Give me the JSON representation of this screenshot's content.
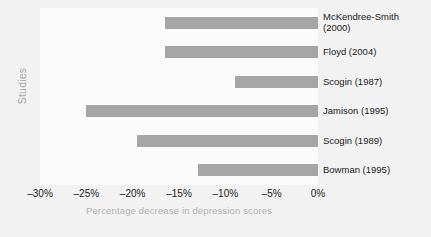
{
  "chart_data": {
    "type": "bar",
    "orientation": "horizontal",
    "title": "",
    "xlabel": "Percentage decrease in depression scores",
    "ylabel": "Studies",
    "categories": [
      "McKendree-Smith\n(2000)",
      "Floyd (2004)",
      "Scogin (1987)",
      "Jamison (1995)",
      "Scogin (1989)",
      "Bowman (1995)"
    ],
    "values": [
      -16.5,
      -16.5,
      -9.0,
      -25.0,
      -19.5,
      -13.0
    ],
    "xlim": [
      -30,
      0
    ],
    "xticks": [
      -30,
      -25,
      -20,
      -15,
      -10,
      -5,
      0
    ],
    "xticklabels": [
      "–30%",
      "–25%",
      "–20%",
      "–15%",
      "–10%",
      "–5%",
      "0%"
    ],
    "grid": false,
    "legend": false,
    "bar_color": "#a6a6a6",
    "plot_background": "#fbfbfb",
    "figure_background": "#f2f2f2",
    "axis_label_color": "#b0b0b0",
    "tick_label_color": "#1a1a1a"
  }
}
